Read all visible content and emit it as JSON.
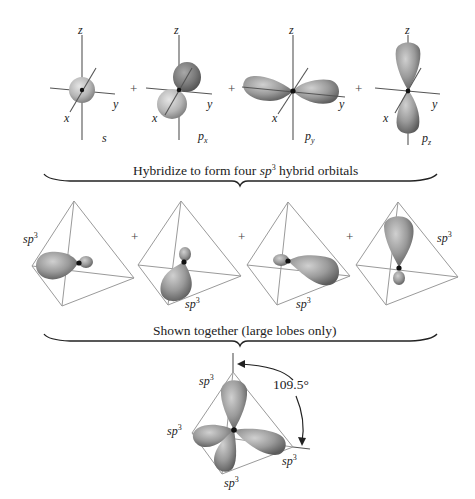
{
  "colors": {
    "lobe_dark": "#6e6e6e",
    "lobe_light": "#c9c9c9",
    "nucleus": "#111111",
    "tetrahedron_edge": "#9a9a9a",
    "axis": "#555555",
    "text": "#222222"
  },
  "row1": {
    "axis_labels": {
      "z": "z",
      "y": "y",
      "x": "x"
    },
    "orbitals": [
      {
        "name": "s",
        "label": "s",
        "sub": ""
      },
      {
        "name": "px",
        "label": "p",
        "sub": "x"
      },
      {
        "name": "py",
        "label": "p",
        "sub": "y"
      },
      {
        "name": "pz",
        "label": "p",
        "sub": "z"
      }
    ],
    "operator": "+"
  },
  "brace1": {
    "text_before": "Hybridize to form four ",
    "text_sp": "sp",
    "text_sup": "3",
    "text_after": " hybrid orbitals"
  },
  "row2": {
    "hybrid_label": "sp",
    "hybrid_sup": "3",
    "operator": "+"
  },
  "brace2": {
    "text": "Shown together (large lobes only)"
  },
  "row3": {
    "hybrid_label": "sp",
    "hybrid_sup": "3",
    "angle": "109.5°"
  }
}
